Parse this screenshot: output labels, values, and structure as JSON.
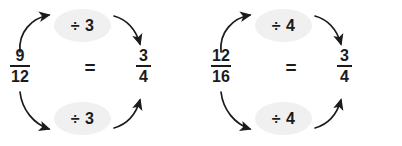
{
  "figure": {
    "background_color": "#ffffff",
    "pill_fill_color": "#f0f0f0",
    "ink_color": "#1b1b1b",
    "equals_symbol": "=",
    "groups": [
      {
        "id": "group-0",
        "start_fraction": {
          "numerator": "9",
          "denominator": "12"
        },
        "result_fraction": {
          "numerator": "3",
          "denominator": "4"
        },
        "equals": "=",
        "operation_top": "÷ 3",
        "operation_bottom": "÷ 3",
        "arrows": [
          {
            "name": "arrow-numerator-to-top-operation",
            "direction": "up-right"
          },
          {
            "name": "arrow-top-operation-to-result",
            "direction": "down-right"
          },
          {
            "name": "arrow-denominator-to-bottom-operation",
            "direction": "down-right"
          },
          {
            "name": "arrow-bottom-operation-to-result",
            "direction": "up-right"
          }
        ]
      },
      {
        "id": "group-1",
        "start_fraction": {
          "numerator": "12",
          "denominator": "16"
        },
        "result_fraction": {
          "numerator": "3",
          "denominator": "4"
        },
        "equals": "=",
        "operation_top": "÷ 4",
        "operation_bottom": "÷ 4",
        "arrows": [
          {
            "name": "arrow-numerator-to-top-operation",
            "direction": "up-right"
          },
          {
            "name": "arrow-top-operation-to-result",
            "direction": "down-right"
          },
          {
            "name": "arrow-denominator-to-bottom-operation",
            "direction": "down-right"
          },
          {
            "name": "arrow-bottom-operation-to-result",
            "direction": "up-right"
          }
        ]
      }
    ]
  }
}
